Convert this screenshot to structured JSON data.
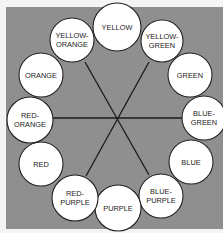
{
  "diagram": {
    "colors": {
      "page_background": "#f4f4f4",
      "panel_background": "#8f8f8f",
      "circle_fill": "#ffffff",
      "circle_stroke": "#222222",
      "line_color": "#1a1a1a"
    },
    "center": [
      117,
      118
    ],
    "nodes": [
      {
        "id": "yellow",
        "lines": [
          "YELLOW"
        ],
        "cx": 117,
        "cy": 27,
        "r": 24
      },
      {
        "id": "yellow-green",
        "lines": [
          "YELLOW-",
          "GREEN"
        ],
        "cx": 162,
        "cy": 41,
        "r": 21
      },
      {
        "id": "green",
        "lines": [
          "GREEN"
        ],
        "cx": 190,
        "cy": 75,
        "r": 22
      },
      {
        "id": "blue-green",
        "lines": [
          "BLUE-",
          "GREEN"
        ],
        "cx": 204,
        "cy": 118,
        "r": 22
      },
      {
        "id": "blue",
        "lines": [
          "BLUE"
        ],
        "cx": 191,
        "cy": 162,
        "r": 22
      },
      {
        "id": "blue-purple",
        "lines": [
          "BLUE-",
          "PURPLE"
        ],
        "cx": 161,
        "cy": 196,
        "r": 22
      },
      {
        "id": "purple",
        "lines": [
          "PURPLE"
        ],
        "cx": 118,
        "cy": 208,
        "r": 23
      },
      {
        "id": "red-purple",
        "lines": [
          "RED-",
          "PURPLE"
        ],
        "cx": 75,
        "cy": 198,
        "r": 23
      },
      {
        "id": "red",
        "lines": [
          "RED"
        ],
        "cx": 41,
        "cy": 164,
        "r": 22
      },
      {
        "id": "red-orange",
        "lines": [
          "RED-",
          "ORANGE"
        ],
        "cx": 30,
        "cy": 120,
        "r": 23
      },
      {
        "id": "orange",
        "lines": [
          "ORANGE"
        ],
        "cx": 41,
        "cy": 75,
        "r": 22
      },
      {
        "id": "yellow-orange",
        "lines": [
          "YELLOW-",
          "ORANGE"
        ],
        "cx": 72,
        "cy": 40,
        "r": 22
      }
    ],
    "connectors": [
      {
        "from": "red-orange",
        "to": "blue-green",
        "x1": 53,
        "y1": 118,
        "x2": 182,
        "y2": 118
      },
      {
        "from": "yellow-orange",
        "to": "blue-purple",
        "x1": 85,
        "y1": 62,
        "x2": 149,
        "y2": 175
      },
      {
        "from": "yellow-green",
        "to": "red-purple",
        "x1": 149,
        "y1": 62,
        "x2": 86,
        "y2": 176
      }
    ]
  }
}
